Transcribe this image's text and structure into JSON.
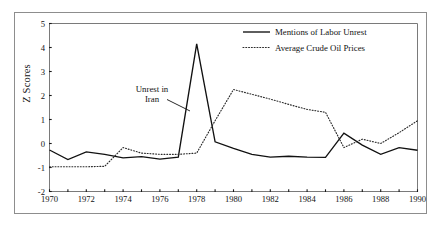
{
  "figure": {
    "background_color": "#ffffff",
    "frame_color": "#8d8d8d",
    "axis_color": "#7a7a7a"
  },
  "annotation": {
    "line1": "Unrest in",
    "line2": "Iran"
  },
  "legend": {
    "position": "top-right",
    "entries": [
      {
        "label": "Mentions of Labor Unrest",
        "style": "solid",
        "color": "#111111"
      },
      {
        "label": "Average Crude Oil Prices",
        "style": "dotted",
        "color": "#2b2b2b"
      }
    ]
  },
  "chart_data": {
    "type": "line",
    "title": "",
    "xlabel": "",
    "ylabel": "Z Scores",
    "xlim": [
      1970,
      1990
    ],
    "ylim": [
      -2,
      5
    ],
    "grid": false,
    "legend_position": "top-right",
    "x": [
      1970,
      1971,
      1972,
      1973,
      1974,
      1975,
      1976,
      1977,
      1978,
      1979,
      1980,
      1981,
      1982,
      1983,
      1984,
      1985,
      1986,
      1987,
      1988,
      1989,
      1990
    ],
    "xticks": [
      1970,
      1972,
      1974,
      1976,
      1978,
      1980,
      1982,
      1984,
      1986,
      1988,
      1990
    ],
    "xtick_labels": [
      "1970",
      "1972",
      "1974",
      "1976",
      "1978",
      "1980",
      "1982",
      "1984",
      "1986",
      "1988",
      "1990"
    ],
    "xminor_ticks": [
      1971,
      1973,
      1975,
      1977,
      1979,
      1981,
      1983,
      1985,
      1987,
      1989
    ],
    "yticks": [
      -2,
      -1,
      0,
      1,
      2,
      3,
      4,
      5
    ],
    "ytick_labels": [
      "-2",
      "-1",
      "0",
      "1",
      "2",
      "3",
      "4",
      "5"
    ],
    "series": [
      {
        "name": "Mentions of Labor Unrest",
        "style": "solid",
        "color": "#111111",
        "values": [
          -0.27,
          -0.67,
          -0.35,
          -0.45,
          -0.6,
          -0.55,
          -0.65,
          -0.57,
          4.15,
          0.07,
          -0.2,
          -0.45,
          -0.57,
          -0.53,
          -0.57,
          -0.58,
          0.43,
          -0.07,
          -0.45,
          -0.17,
          -0.28
        ]
      },
      {
        "name": "Average Crude Oil Prices",
        "style": "dotted",
        "color": "#2b2b2b",
        "values": [
          -0.97,
          -0.97,
          -0.97,
          -0.95,
          -0.17,
          -0.4,
          -0.45,
          -0.45,
          -0.4,
          0.95,
          2.25,
          2.05,
          1.85,
          1.63,
          1.42,
          1.3,
          -0.17,
          0.18,
          0.0,
          0.45,
          0.95
        ]
      }
    ],
    "annotations": [
      {
        "text": "Unrest in Iran",
        "target_x": 1978,
        "target_y": 4.15
      }
    ]
  }
}
